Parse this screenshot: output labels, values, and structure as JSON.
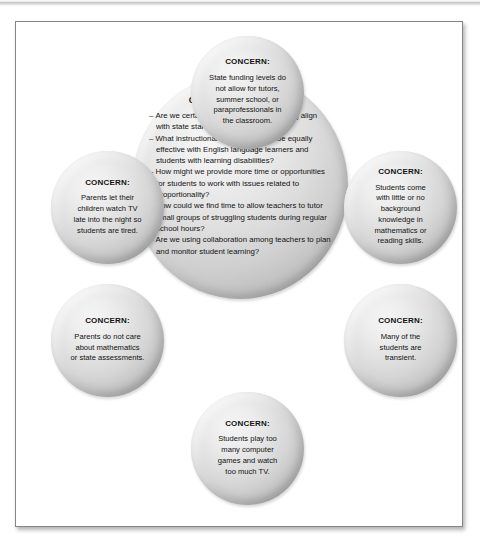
{
  "figure": {
    "center": {
      "title": "CIRCLE OF INFLUENCE",
      "items": [
        "Are we certain that the texts we are using align with state standards?",
        "What instructional strategies might be equally effective with English language learners and students with learning disabilities?",
        "How might we provide more time or opportunities for students to work with issues related to proportionality?",
        "How could we find time to allow teachers to tutor small groups of struggling students during regular school hours?",
        "Are we using collaboration among teachers to plan and monitor student learning?"
      ]
    },
    "concerns": [
      {
        "id": "top",
        "title": "CONCERN:",
        "body": "State funding levels do\nnot allow for tutors,\nsummer school, or\nparaprofessionals in\nthe classroom."
      },
      {
        "id": "left-top",
        "title": "CONCERN:",
        "body": "Parents let their\nchildren watch TV\nlate into the night so\nstudents are tired."
      },
      {
        "id": "left-bottom",
        "title": "CONCERN:",
        "body": "Parents do not care\nabout mathematics\nor state assessments."
      },
      {
        "id": "right-top",
        "title": "CONCERN:",
        "body": "Students come\nwith little or no\nbackground\nknowledge in\nmathematics or\nreading skills."
      },
      {
        "id": "right-bottom",
        "title": "CONCERN:",
        "body": "Many of the\nstudents are\ntransient."
      },
      {
        "id": "bottom",
        "title": "CONCERN:",
        "body": "Students play too\nmany computer\ngames and watch\ntoo much TV."
      }
    ]
  },
  "colors": {
    "bubble_light": "#f4f4f4",
    "bubble_mid": "#cfcfcf",
    "bubble_edge": "#9a9a9a",
    "text": "#121212",
    "frame_border": "#868686",
    "page_background": "#ffffff"
  }
}
